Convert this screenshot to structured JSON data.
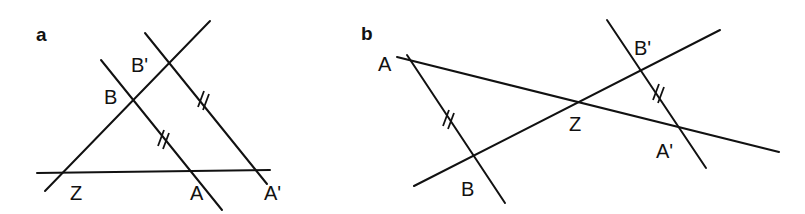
{
  "figure": {
    "panels": [
      {
        "id": "a",
        "label": "a",
        "points": {
          "Z": "Z",
          "A": "A",
          "A_prime": "A'",
          "B": "B",
          "B_prime": "B'"
        },
        "description": "Two parallel lines AB and A'B' cut by lines through Z; segments AB and A'B' marked equal"
      },
      {
        "id": "b",
        "label": "b",
        "points": {
          "Z": "Z",
          "A": "A",
          "A_prime": "A'",
          "B": "B",
          "B_prime": "B'"
        },
        "description": "Lines AA' and BB' intersect at Z; parallel segments AB and A'B' marked equal"
      }
    ],
    "colors": {
      "ink": "#111111",
      "background": "#ffffff"
    }
  }
}
